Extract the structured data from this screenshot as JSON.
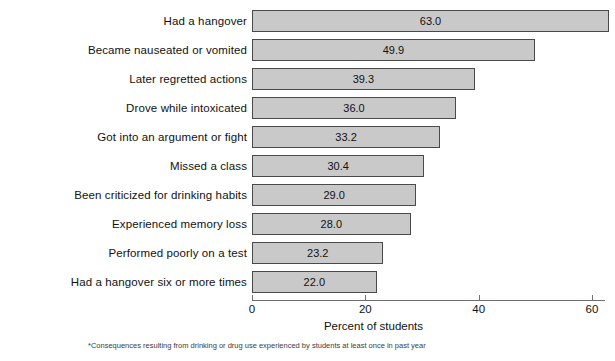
{
  "top_remnant": "",
  "chart_data": {
    "type": "bar",
    "orientation": "horizontal",
    "title": "",
    "xlabel": "Percent of students",
    "ylabel": "",
    "xlim": [
      0,
      62.5
    ],
    "xticks": [
      0,
      20,
      40,
      60
    ],
    "xtick_labels": [
      "0",
      "20",
      "40",
      "60"
    ],
    "grid": false,
    "legend": null,
    "bar_fill_color": "#c9c9c9",
    "bar_edge_color": "#4a4a4a",
    "categories": [
      "Had a hangover",
      "Became nauseated or vomited",
      "Later regretted actions",
      "Drove while intoxicated",
      "Got into an argument or fight",
      "Missed a class",
      "Been criticized for drinking habits",
      "Experienced memory loss",
      "Performed poorly on a test",
      "Had a hangover six or more times"
    ],
    "values": [
      63.0,
      49.9,
      39.3,
      36.0,
      33.2,
      30.4,
      29.0,
      28.0,
      23.2,
      22.0
    ],
    "value_labels": [
      "63.0",
      "49.9",
      "39.3",
      "36.0",
      "33.2",
      "30.4",
      "29.0",
      "28.0",
      "23.2",
      "22.0"
    ]
  },
  "footnote": "*Consequences resulting from drinking or drug use experienced by students at least once in past year"
}
